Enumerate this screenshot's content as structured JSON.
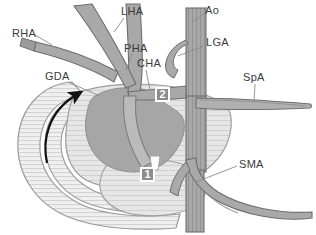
{
  "figure": {
    "width": 316,
    "height": 235,
    "background": "#ffffff"
  },
  "labels": [
    {
      "id": "rha",
      "text": "RHA",
      "x": 12,
      "y": 28,
      "name": "label-rha"
    },
    {
      "id": "lha",
      "text": "LHA",
      "x": 121,
      "y": 6,
      "name": "label-lha"
    },
    {
      "id": "pha",
      "text": "PHA",
      "x": 124,
      "y": 43,
      "name": "label-pha"
    },
    {
      "id": "cha",
      "text": "CHA",
      "x": 137,
      "y": 58,
      "name": "label-cha"
    },
    {
      "id": "gda",
      "text": "GDA",
      "x": 45,
      "y": 71,
      "name": "label-gda"
    },
    {
      "id": "ao",
      "text": "Ao",
      "x": 205,
      "y": 5,
      "name": "label-ao"
    },
    {
      "id": "lga",
      "text": "LGA",
      "x": 206,
      "y": 37,
      "name": "label-lga"
    },
    {
      "id": "spa",
      "text": "SpA",
      "x": 243,
      "y": 72,
      "name": "label-spa"
    },
    {
      "id": "sma",
      "text": "SMA",
      "x": 239,
      "y": 159,
      "name": "label-sma"
    }
  ],
  "markers": [
    {
      "id": "m2",
      "text": "2",
      "x": 155,
      "y": 87,
      "name": "marker-2"
    },
    {
      "id": "m1",
      "text": "1",
      "x": 140,
      "y": 167,
      "name": "marker-1"
    }
  ],
  "colors": {
    "artery_fill": "#a9a9a9",
    "artery_stroke": "#6e6e6e",
    "aorta_fill": "#9c9c9c",
    "pancreas_fill": "#e2e2e2",
    "pancreas_stroke": "#9a9a9a",
    "tumor_fill": "#a6a6a6",
    "tumor_stroke": "#8f8f8f",
    "duodenum_fill": "#ededed",
    "duodenum_stroke": "#9a9a9a",
    "hatch": "#cfcfcf",
    "leader_line": "#8a8a8a",
    "arrow": "#111111",
    "marker_box": "#8c8c8c",
    "marker_text": "#ffffff",
    "label_text": "#3a3a3a"
  },
  "structures": [
    {
      "abbr": "RHA",
      "name": "right-hepatic-artery"
    },
    {
      "abbr": "LHA",
      "name": "left-hepatic-artery"
    },
    {
      "abbr": "PHA",
      "name": "proper-hepatic-artery"
    },
    {
      "abbr": "CHA",
      "name": "common-hepatic-artery"
    },
    {
      "abbr": "GDA",
      "name": "gastroduodenal-artery"
    },
    {
      "abbr": "Ao",
      "name": "aorta"
    },
    {
      "abbr": "LGA",
      "name": "left-gastric-artery"
    },
    {
      "abbr": "SpA",
      "name": "splenic-artery"
    },
    {
      "abbr": "SMA",
      "name": "superior-mesenteric-artery"
    }
  ]
}
